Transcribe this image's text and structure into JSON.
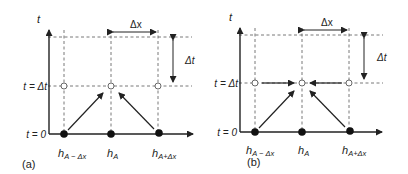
{
  "panels": [
    {
      "id": "a",
      "caption": "(a)",
      "axis_label_t": "t",
      "row_labels": {
        "t_dt": "t = Δt",
        "t_0": "t = 0"
      },
      "delta_x": "Δx",
      "delta_t": "Δt",
      "nodes": [
        {
          "label_main": "h",
          "label_sub": "A − Δx"
        },
        {
          "label_main": "h",
          "label_sub": "A"
        },
        {
          "label_main": "h",
          "label_sub": "A+Δx"
        }
      ],
      "scheme": "explicit"
    },
    {
      "id": "b",
      "caption": "(b)",
      "axis_label_t": "t",
      "row_labels": {
        "t_dt": "t = Δt",
        "t_0": "t = 0"
      },
      "delta_x": "Δx",
      "delta_t": "Δt",
      "nodes": [
        {
          "label_main": "h",
          "label_sub": "A − Δx"
        },
        {
          "label_main": "h",
          "label_sub": "A"
        },
        {
          "label_main": "h",
          "label_sub": "A+Δx"
        }
      ],
      "scheme": "implicit"
    }
  ],
  "colors": {
    "ink": "#222222",
    "dash": "#555555",
    "background": "#ffffff"
  }
}
